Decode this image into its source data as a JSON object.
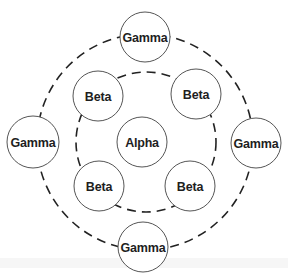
{
  "diagram": {
    "type": "concentric-ring-diagram",
    "colors": {
      "background": "#ffffff",
      "node_fill": "#ffffff",
      "node_stroke": "#555555",
      "ring_stroke": "#222222",
      "label": "#1e1e1e"
    },
    "rings": [
      {
        "name": "inner-ring",
        "cx": 146,
        "cy": 142,
        "r": 70,
        "style": "dashed"
      },
      {
        "name": "outer-ring",
        "cx": 145,
        "cy": 142,
        "r": 108,
        "style": "dashed"
      }
    ],
    "center": {
      "label": "Alpha",
      "cx": 142,
      "cy": 142,
      "r": 25
    },
    "inner_nodes": [
      {
        "label": "Beta",
        "cx": 98,
        "cy": 96,
        "r": 25
      },
      {
        "label": "Beta",
        "cx": 196,
        "cy": 94,
        "r": 25
      },
      {
        "label": "Beta",
        "cx": 99,
        "cy": 186,
        "r": 25
      },
      {
        "label": "Beta",
        "cx": 190,
        "cy": 186,
        "r": 25
      }
    ],
    "outer_nodes": [
      {
        "label": "Gamma",
        "cx": 145,
        "cy": 37,
        "r": 25
      },
      {
        "label": "Gamma",
        "cx": 33,
        "cy": 142,
        "r": 26
      },
      {
        "label": "Gamma",
        "cx": 256,
        "cy": 143,
        "r": 25
      },
      {
        "label": "Gamma",
        "cx": 143,
        "cy": 247,
        "r": 25
      }
    ]
  }
}
